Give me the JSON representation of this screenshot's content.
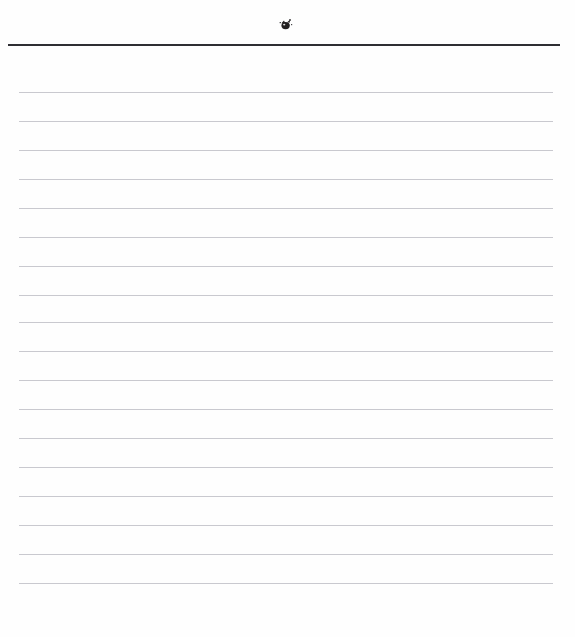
{
  "page": {
    "kind": "ruled-notepad-page",
    "width": 575,
    "height": 637,
    "background_color": "#fefefe",
    "content_text": "",
    "is_blank": true
  },
  "masthead": {
    "ornament_icon": "ornament-mark",
    "ornament_color": "#221f20",
    "ornament_center_x": 286,
    "ornament_center_y": 24,
    "ornament_width": 16,
    "ornament_height": 14
  },
  "header_rule": {
    "color": "#2e2e33",
    "x": 8,
    "y": 44,
    "width": 552,
    "height": 2
  },
  "ruled_lines": {
    "color": "#c9c9cf",
    "left": 19,
    "width": 534,
    "thickness": 1,
    "spacing": 29,
    "count": 17,
    "y_positions": [
      92,
      121,
      150,
      179,
      208,
      237,
      266,
      295,
      322,
      351,
      380,
      409,
      438,
      467,
      496,
      525,
      554,
      583
    ]
  }
}
